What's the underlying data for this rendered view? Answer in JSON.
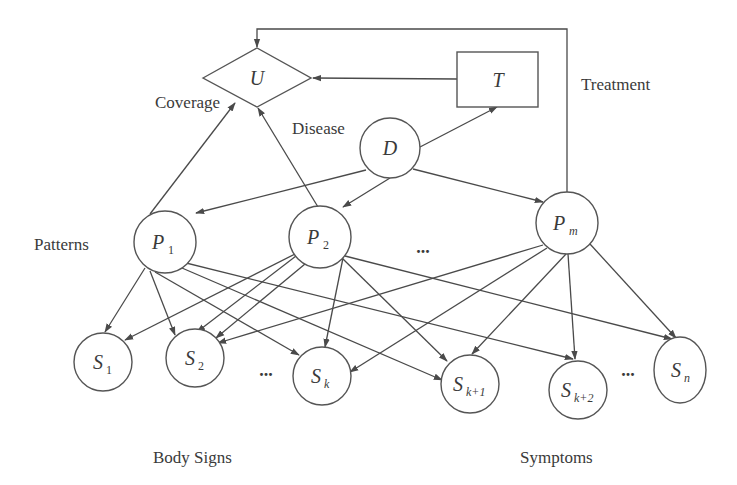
{
  "diagram": {
    "type": "bayesian-network",
    "group_labels": {
      "coverage": "Coverage",
      "disease": "Disease",
      "treatment": "Treatment",
      "patterns": "Patterns",
      "body_signs": "Body Signs",
      "symptoms": "Symptoms"
    },
    "nodes": {
      "U": {
        "label": "U",
        "shape": "diamond"
      },
      "T": {
        "label": "T",
        "shape": "rectangle"
      },
      "D": {
        "label": "D",
        "shape": "circle"
      },
      "P1": {
        "label": "P",
        "sub": "1",
        "shape": "circle"
      },
      "P2": {
        "label": "P",
        "sub": "2",
        "shape": "circle"
      },
      "Pm": {
        "label": "P",
        "sub": "m",
        "shape": "circle"
      },
      "S1": {
        "label": "S",
        "sub": "1",
        "shape": "circle"
      },
      "S2": {
        "label": "S",
        "sub": "2",
        "shape": "circle"
      },
      "Sk": {
        "label": "S",
        "sub": "k",
        "shape": "circle"
      },
      "Sk1": {
        "label": "S",
        "sub": "k+1",
        "shape": "circle"
      },
      "Sk2": {
        "label": "S",
        "sub": "k+2",
        "shape": "circle"
      },
      "Sn": {
        "label": "S",
        "sub": "n",
        "shape": "circle"
      }
    },
    "ellipses": {
      "patterns": "...",
      "signs": "...",
      "symptoms": "..."
    },
    "edges": [
      [
        "T",
        "U"
      ],
      [
        "D",
        "T"
      ],
      [
        "D",
        "P1"
      ],
      [
        "D",
        "P2"
      ],
      [
        "D",
        "Pm"
      ],
      [
        "P1",
        "U"
      ],
      [
        "P2",
        "U"
      ],
      [
        "Pm",
        "U"
      ],
      [
        "P1",
        "S1"
      ],
      [
        "P1",
        "S2"
      ],
      [
        "P1",
        "Sk"
      ],
      [
        "P1",
        "Sk1"
      ],
      [
        "P1",
        "Sk2"
      ],
      [
        "P2",
        "S1"
      ],
      [
        "P2",
        "S2"
      ],
      [
        "P2",
        "Sk"
      ],
      [
        "P2",
        "Sk1"
      ],
      [
        "P2",
        "Sn"
      ],
      [
        "Pm",
        "S2"
      ],
      [
        "Pm",
        "Sk"
      ],
      [
        "Pm",
        "Sk1"
      ],
      [
        "Pm",
        "Sk2"
      ],
      [
        "Pm",
        "Sn"
      ]
    ]
  }
}
